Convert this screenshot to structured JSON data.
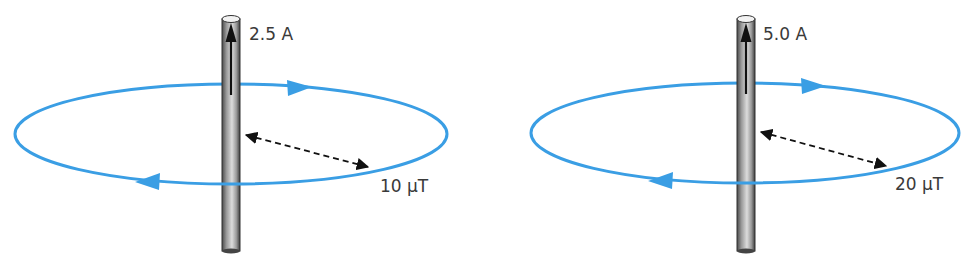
{
  "diagrams": [
    {
      "current_label": "2.5 A",
      "field_label": "10 µT",
      "wire": {
        "x": 222,
        "width": 18,
        "top": 16,
        "bottom": 252
      },
      "loop": {
        "cx": 231,
        "cy": 134,
        "rx": 216,
        "ry": 50
      }
    },
    {
      "current_label": "5.0 A",
      "field_label": "20 µT",
      "wire": {
        "x": 737,
        "width": 18,
        "top": 16,
        "bottom": 252
      },
      "loop": {
        "cx": 745,
        "cy": 133,
        "rx": 214,
        "ry": 50
      }
    }
  ],
  "colors": {
    "field_line": "#3a9ee4",
    "wire_dark": "#555555",
    "wire_light": "#d8d8d8",
    "text": "#3a3a3a"
  }
}
